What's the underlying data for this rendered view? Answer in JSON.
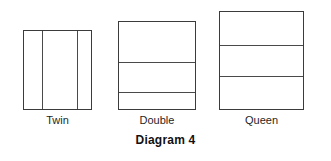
{
  "figure": {
    "caption": "Diagram 4",
    "background_color": "#ffffff",
    "line_color": "#3b3b3b",
    "divider_color": "#4a4a4a",
    "text_color": "#1f1f1f"
  },
  "beds": [
    {
      "label": "Twin",
      "orientation": "vertical-panels",
      "panel_count": 3,
      "box": {
        "x": 23,
        "y": 30,
        "width": 69,
        "height": 80
      },
      "dividers": [
        18,
        53
      ],
      "label_x": 23,
      "label_width": 69,
      "label_y": 114
    },
    {
      "label": "Double",
      "orientation": "horizontal-rows",
      "panel_count": 3,
      "box": {
        "x": 118,
        "y": 21,
        "width": 78,
        "height": 89
      },
      "dividers": [
        40,
        70
      ],
      "label_x": 118,
      "label_width": 78,
      "label_y": 114
    },
    {
      "label": "Queen",
      "orientation": "horizontal-rows",
      "panel_count": 3,
      "box": {
        "x": 219,
        "y": 11,
        "width": 85,
        "height": 99
      },
      "dividers": [
        33,
        64
      ],
      "label_x": 219,
      "label_width": 85,
      "label_y": 114
    }
  ]
}
